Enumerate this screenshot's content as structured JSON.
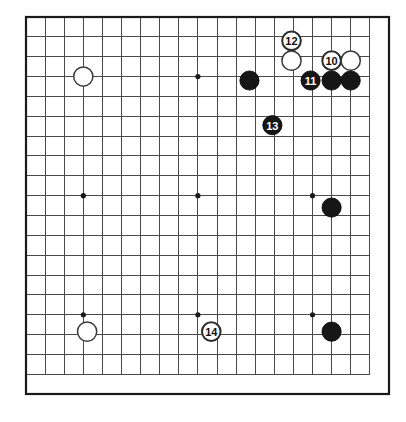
{
  "diagram": {
    "board_size": 19,
    "background_color": "#ffffff",
    "line_color": "#4a4a4a",
    "border_color": "#1a1a1a",
    "black_stone_color": "#161616",
    "white_stone_color": "#ffffff",
    "stone_radius": 9.6,
    "geometry": {
      "left": 26,
      "top": 17,
      "right": 389,
      "bottom": 394,
      "cell_x": 19.1,
      "cell_y": 19.85
    },
    "hoshi": [
      {
        "name": "hoshi-upper-left",
        "col": 3,
        "row": 3
      },
      {
        "name": "hoshi-upper-middle",
        "col": 9,
        "row": 3
      },
      {
        "name": "hoshi-upper-right",
        "col": 15,
        "row": 3
      },
      {
        "name": "hoshi-middle-left",
        "col": 3,
        "row": 9
      },
      {
        "name": "hoshi-center",
        "col": 9,
        "row": 9
      },
      {
        "name": "hoshi-middle-right",
        "col": 15,
        "row": 9
      },
      {
        "name": "hoshi-lower-left",
        "col": 3,
        "row": 15
      },
      {
        "name": "hoshi-lower-middle",
        "col": 9,
        "row": 15
      },
      {
        "name": "hoshi-lower-right",
        "col": 15,
        "row": 15
      }
    ],
    "stones": [
      {
        "id": "stone-w-upper-left",
        "color": "white",
        "col": 3,
        "row": 3,
        "label": null
      },
      {
        "id": "stone-b-upper-right-area",
        "color": "black",
        "col": 11.7,
        "row": 3.2,
        "label": null
      },
      {
        "id": "stone-w-move-12",
        "color": "white",
        "col": 13.9,
        "row": 1.2,
        "label": "12",
        "label_style": "circle-outline"
      },
      {
        "id": "stone-w-upper-right-lower",
        "color": "white",
        "col": 13.9,
        "row": 2.2,
        "label": null
      },
      {
        "id": "stone-w-move-10",
        "color": "white",
        "col": 16.0,
        "row": 2.2,
        "label": "10",
        "label_style": "circle-outline"
      },
      {
        "id": "stone-w-upper-right-corner",
        "color": "white",
        "col": 17.0,
        "row": 2.2,
        "label": null
      },
      {
        "id": "stone-b-move-11",
        "color": "black",
        "col": 14.9,
        "row": 3.2,
        "label": "11",
        "label_style": "solid-on-black"
      },
      {
        "id": "stone-b-right-1",
        "color": "black",
        "col": 16.0,
        "row": 3.2,
        "label": null
      },
      {
        "id": "stone-b-right-2",
        "color": "black",
        "col": 17.0,
        "row": 3.2,
        "label": null
      },
      {
        "id": "stone-b-move-13",
        "color": "black",
        "col": 12.9,
        "row": 5.45,
        "label": "13",
        "label_style": "solid-on-black"
      },
      {
        "id": "stone-b-right-center",
        "color": "black",
        "col": 16.0,
        "row": 9.6,
        "label": null
      },
      {
        "id": "stone-w-lower-left",
        "color": "white",
        "col": 3.2,
        "row": 15.85,
        "label": null
      },
      {
        "id": "stone-w-move-14",
        "color": "white",
        "col": 9.7,
        "row": 15.85,
        "label": "14",
        "label_style": "circle-outline"
      },
      {
        "id": "stone-b-lower-right",
        "color": "black",
        "col": 16.0,
        "row": 15.85,
        "label": null
      }
    ],
    "move_labels": [
      "10",
      "11",
      "12",
      "13",
      "14"
    ]
  }
}
